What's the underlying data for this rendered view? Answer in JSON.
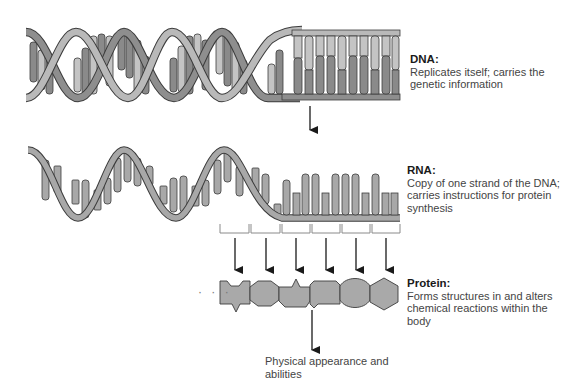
{
  "diagram": {
    "colors": {
      "strand_light": "#b9b9b9",
      "strand_dark": "#8e8e8e",
      "base_dark": "#8a8a8a",
      "base_light": "#c4c4c4",
      "outline": "#3c3c3c",
      "protein_fill": "#a9a9a9",
      "arrow": "#1a1a1a",
      "codon_bracket": "#8a8a8a"
    },
    "stages": [
      {
        "id": "dna",
        "title": "DNA:",
        "description": "Replicates itself; carries the genetic information"
      },
      {
        "id": "rna",
        "title": "RNA:",
        "description": "Copy of one strand of the DNA; carries instructions for protein synthesis"
      },
      {
        "id": "protein",
        "title": "Protein:",
        "description": "Forms structures in and alters chemical reactions within the body"
      }
    ],
    "outcome": {
      "text": "Physical appearance and abilities"
    },
    "codon_count": 6,
    "protein_ellipsis": "· · ·",
    "amino_acid_shapes": [
      "notched-hexagon",
      "octagon",
      "spiked-pentagon",
      "notched-square",
      "circle",
      "hexagon"
    ]
  }
}
